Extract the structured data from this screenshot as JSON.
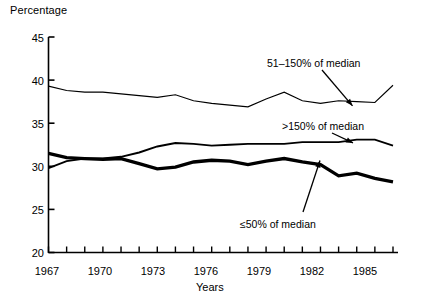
{
  "chart_data": {
    "type": "line",
    "title": "",
    "xlabel": "Years",
    "ylabel": "Percentage",
    "ylim": [
      20,
      45
    ],
    "xlim": [
      1967,
      1986
    ],
    "yticks": [
      20,
      25,
      30,
      35,
      40,
      45
    ],
    "xticks_labeled": [
      1967,
      1970,
      1973,
      1976,
      1979,
      1982,
      1985
    ],
    "xticks_all": [
      1967,
      1968,
      1969,
      1970,
      1971,
      1972,
      1973,
      1974,
      1975,
      1976,
      1977,
      1978,
      1979,
      1980,
      1981,
      1982,
      1983,
      1984,
      1985,
      1986
    ],
    "grid": false,
    "legend_position": "inline-annotations",
    "x": [
      1967,
      1968,
      1969,
      1970,
      1971,
      1972,
      1973,
      1974,
      1975,
      1976,
      1977,
      1978,
      1979,
      1980,
      1981,
      1982,
      1983,
      1984,
      1985,
      1986
    ],
    "series": [
      {
        "name": "51-150% of median",
        "style": "thin",
        "values": [
          39.3,
          38.8,
          38.6,
          38.6,
          38.4,
          38.2,
          38.0,
          38.3,
          37.6,
          37.3,
          37.1,
          36.9,
          37.8,
          38.6,
          37.6,
          37.3,
          37.6,
          37.5,
          37.4,
          39.4
        ]
      },
      {
        "name": ">150% of median",
        "style": "medium",
        "values": [
          29.8,
          30.6,
          30.9,
          30.9,
          31.1,
          31.6,
          32.3,
          32.7,
          32.6,
          32.4,
          32.5,
          32.6,
          32.6,
          32.6,
          32.8,
          32.8,
          32.8,
          33.1,
          33.1,
          32.4
        ]
      },
      {
        "name": "<=50% of median",
        "style": "thick",
        "values": [
          31.5,
          31.0,
          30.9,
          30.8,
          30.9,
          30.3,
          29.7,
          29.9,
          30.5,
          30.7,
          30.6,
          30.2,
          30.6,
          30.9,
          30.5,
          30.2,
          28.9,
          29.2,
          28.6,
          28.2
        ]
      }
    ],
    "annotations": [
      {
        "text": "51–150% of median",
        "series": "51-150% of median",
        "points_to_year": 1978
      },
      {
        "text": ">150% of median",
        "series": ">150% of median",
        "points_to_year": 1978
      },
      {
        "text": "≤50% of median",
        "series": "<=50% of median",
        "points_to_year": 1980
      }
    ]
  },
  "axis": {
    "y_title": "Percentage",
    "x_title": "Years",
    "y_tick_labels": [
      "45",
      "40",
      "35",
      "30",
      "25",
      "20"
    ],
    "x_tick_labels": [
      "1967",
      "1970",
      "1973",
      "1976",
      "1979",
      "1982",
      "1985"
    ]
  },
  "annotations": {
    "upper": "51–150% of median",
    "middle": ">150% of median",
    "lower": "≤50% of median"
  },
  "colors": {
    "ink": "#000000",
    "background": "#ffffff"
  }
}
